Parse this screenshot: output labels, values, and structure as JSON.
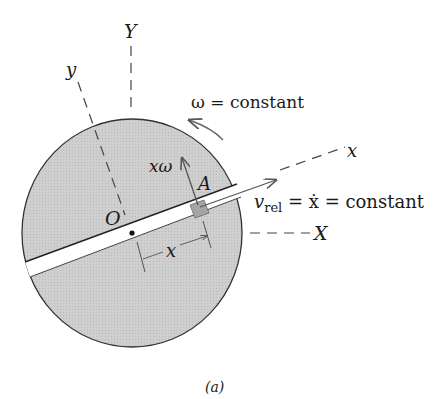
{
  "figure": {
    "caption": "(a)",
    "labels": {
      "Y_axis": "Y",
      "y_axis": "y",
      "x_axis": "x",
      "X_axis": "X",
      "origin": "O",
      "point": "A",
      "omega": "ω = constant",
      "x_omega": "xω",
      "v_rel_main": "v",
      "v_rel_sub": "rel",
      "v_rel_rest": " = ẋ = constant",
      "distance": "x"
    },
    "colors": {
      "disk_fill": "#c9c9c9",
      "disk_stroke": "#333333",
      "slot_fill": "#ffffff",
      "arrow": "#555555",
      "dashed": "#444444",
      "block_fill": "#a8a8a8"
    }
  }
}
